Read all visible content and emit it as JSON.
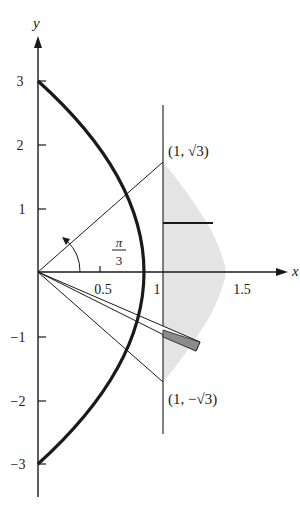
{
  "figure": {
    "type": "polar-region-diagram",
    "axes": {
      "x_label": "x",
      "y_label": "y",
      "x_ticks": [
        {
          "value": 0.5,
          "label": "0.5"
        },
        {
          "value": 1,
          "label": "1"
        },
        {
          "value": 1.5,
          "label": "1.5"
        }
      ],
      "y_ticks": [
        {
          "value": 3,
          "label": "3"
        },
        {
          "value": 2,
          "label": "2"
        },
        {
          "value": 1,
          "label": "1"
        },
        {
          "value": -1,
          "label": "−1"
        },
        {
          "value": -2,
          "label": "−2"
        },
        {
          "value": -3,
          "label": "−3"
        }
      ]
    },
    "curve": {
      "description": "parabola x = 1.5 - y^2/6 (r = 3/(1+cosθ))",
      "vertex": [
        1.5,
        0
      ],
      "y_intercepts": [
        3,
        -3
      ]
    },
    "vertical_line": {
      "x": 1
    },
    "points": [
      {
        "label_prefix": "(1, ",
        "label_radical": "√3",
        "label_suffix": ")",
        "x": 1,
        "y": 1.732
      },
      {
        "label_prefix": "(1, −",
        "label_radical": "√3",
        "label_suffix": ")",
        "x": 1,
        "y": -1.732
      }
    ],
    "angle_annotation": {
      "numerator": "π",
      "denominator": "3"
    },
    "shaded_region": "region between x = 1 and the parabola, for -√3 ≤ y ≤ √3",
    "colors": {
      "ink": "#1a1a1a",
      "shade": "#e4e4e4",
      "wedge": "#8c8c8c"
    }
  }
}
